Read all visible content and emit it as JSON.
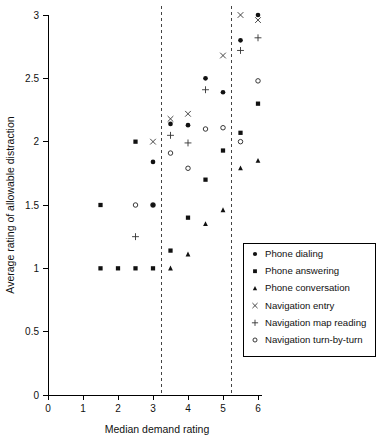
{
  "chart_data": {
    "type": "scatter",
    "title": "",
    "xlabel": "Median demand rating",
    "ylabel": "Average rating of allowable distraction",
    "xlim": [
      0,
      6
    ],
    "ylim": [
      0,
      3
    ],
    "xticks": [
      "0",
      "1",
      "2",
      "3",
      "4",
      "5",
      "6"
    ],
    "yticks": [
      "0",
      "0.5",
      "1",
      "1.5",
      "2",
      "2.5",
      "3"
    ],
    "grid": false,
    "legend_position": "bottom-right",
    "reference_lines": [
      {
        "type": "vertical",
        "x": 3.25,
        "style": "dashed"
      },
      {
        "type": "vertical",
        "x": 5.25,
        "style": "dashed"
      }
    ],
    "series": [
      {
        "name": "Phone dialing",
        "marker": "filled-circle",
        "points": [
          {
            "x": 3.0,
            "y": 1.84
          },
          {
            "x": 3.0,
            "y": 1.5
          },
          {
            "x": 3.5,
            "y": 2.14
          },
          {
            "x": 4.0,
            "y": 2.13
          },
          {
            "x": 4.5,
            "y": 2.5
          },
          {
            "x": 5.0,
            "y": 2.39
          },
          {
            "x": 5.5,
            "y": 2.8
          },
          {
            "x": 6.0,
            "y": 3.0
          }
        ]
      },
      {
        "name": "Phone answering",
        "marker": "filled-square",
        "points": [
          {
            "x": 1.5,
            "y": 1.5
          },
          {
            "x": 1.5,
            "y": 1.0
          },
          {
            "x": 2.0,
            "y": 1.0
          },
          {
            "x": 2.5,
            "y": 2.0
          },
          {
            "x": 2.5,
            "y": 1.0
          },
          {
            "x": 3.0,
            "y": 1.5
          },
          {
            "x": 3.0,
            "y": 1.0
          },
          {
            "x": 3.5,
            "y": 1.14
          },
          {
            "x": 4.0,
            "y": 1.4
          },
          {
            "x": 4.5,
            "y": 1.7
          },
          {
            "x": 5.0,
            "y": 1.93
          },
          {
            "x": 5.5,
            "y": 2.07
          },
          {
            "x": 6.0,
            "y": 2.3
          }
        ]
      },
      {
        "name": "Phone conversation",
        "marker": "filled-triangle",
        "points": [
          {
            "x": 3.5,
            "y": 1.0
          },
          {
            "x": 4.0,
            "y": 1.11
          },
          {
            "x": 4.5,
            "y": 1.35
          },
          {
            "x": 5.0,
            "y": 1.46
          },
          {
            "x": 5.5,
            "y": 1.79
          },
          {
            "x": 6.0,
            "y": 1.85
          }
        ]
      },
      {
        "name": "Navigation entry",
        "marker": "cross-x",
        "points": [
          {
            "x": 3.0,
            "y": 2.0
          },
          {
            "x": 3.5,
            "y": 2.18
          },
          {
            "x": 4.0,
            "y": 2.22
          },
          {
            "x": 5.0,
            "y": 2.68
          },
          {
            "x": 5.5,
            "y": 3.0
          },
          {
            "x": 6.0,
            "y": 2.96
          }
        ]
      },
      {
        "name": "Navigation map reading",
        "marker": "plus",
        "points": [
          {
            "x": 2.5,
            "y": 1.25
          },
          {
            "x": 3.5,
            "y": 2.05
          },
          {
            "x": 4.0,
            "y": 1.99
          },
          {
            "x": 4.5,
            "y": 2.41
          },
          {
            "x": 5.5,
            "y": 2.72
          },
          {
            "x": 6.0,
            "y": 2.82
          }
        ]
      },
      {
        "name": "Navigation turn-by-turn",
        "marker": "open-circle",
        "points": [
          {
            "x": 2.5,
            "y": 1.5
          },
          {
            "x": 3.0,
            "y": 1.5
          },
          {
            "x": 3.5,
            "y": 1.91
          },
          {
            "x": 4.0,
            "y": 1.79
          },
          {
            "x": 4.5,
            "y": 2.1
          },
          {
            "x": 5.0,
            "y": 2.11
          },
          {
            "x": 5.5,
            "y": 2.0
          },
          {
            "x": 6.0,
            "y": 2.48
          }
        ]
      }
    ]
  },
  "legend": {
    "items": [
      {
        "label": "Phone dialing",
        "marker": "filled-circle"
      },
      {
        "label": "Phone answering",
        "marker": "filled-square"
      },
      {
        "label": "Phone conversation",
        "marker": "filled-triangle"
      },
      {
        "label": "Navigation entry",
        "marker": "cross-x"
      },
      {
        "label": "Navigation map reading",
        "marker": "plus"
      },
      {
        "label": "Navigation turn-by-turn",
        "marker": "open-circle"
      }
    ]
  }
}
